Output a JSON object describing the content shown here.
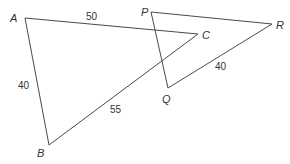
{
  "diagram": {
    "type": "two triangles",
    "triangles": [
      {
        "name": "ABC",
        "vertices": {
          "A": {
            "label": "A",
            "x": 25,
            "y": 18
          },
          "B": {
            "label": "B",
            "x": 49,
            "y": 145
          },
          "C": {
            "label": "C",
            "x": 198,
            "y": 34
          }
        },
        "sides": {
          "AC": {
            "label": "50"
          },
          "AB": {
            "label": "40"
          },
          "BC": {
            "label": "55"
          }
        }
      },
      {
        "name": "PQR",
        "vertices": {
          "P": {
            "label": "P",
            "x": 151,
            "y": 12
          },
          "Q": {
            "label": "Q",
            "x": 168,
            "y": 88
          },
          "R": {
            "label": "R",
            "x": 272,
            "y": 24
          }
        },
        "sides": {
          "QR": {
            "label": "40"
          }
        }
      }
    ],
    "colors": {
      "line": "#4a4a4a",
      "text": "#333333",
      "background": "#ffffff"
    }
  }
}
